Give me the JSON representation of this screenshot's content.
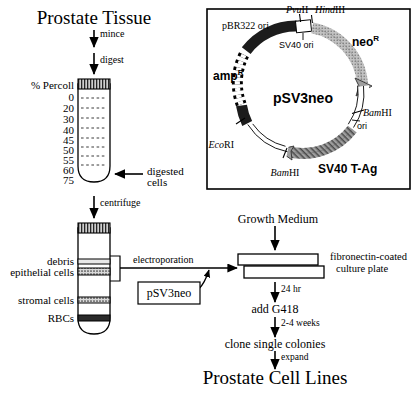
{
  "figure": {
    "title_top": "Prostate Tissue",
    "title_bottom": "Prostate Cell Lines"
  },
  "steps": {
    "mince": "mince",
    "digest": "digest",
    "centrifuge": "centrifuge",
    "electroporation": "electroporation",
    "incubate_24hr": "24 hr",
    "add_g418": "add G418",
    "weeks_2_4": "2-4 weeks",
    "clone_colonies": "clone single colonies",
    "expand": "expand"
  },
  "percoll_tube": {
    "axis_label": "% Percoll",
    "gradient_values": [
      "0",
      "20",
      "30",
      "40",
      "45",
      "50",
      "55",
      "60",
      "75"
    ],
    "callout": [
      "digested",
      "cells"
    ]
  },
  "separation_tube": {
    "layers": [
      {
        "name": "debris",
        "label": "debris"
      },
      {
        "name": "epithelial-cells",
        "label": "epithelial cells"
      },
      {
        "name": "stromal-cells",
        "label": "stromal cells"
      },
      {
        "name": "rbcs",
        "label": "RBCs"
      }
    ]
  },
  "plasmid": {
    "name": "pSV3neo",
    "genes": [
      {
        "id": "pbr322-ori",
        "label": "pBR322 ori"
      },
      {
        "id": "amp-r",
        "label": "amp",
        "superscript": "R"
      },
      {
        "id": "neo-r",
        "label": "neo",
        "superscript": "R"
      },
      {
        "id": "sv40-t-ag",
        "label": "SV40 T-Ag"
      }
    ],
    "features": [
      {
        "id": "sv40-ori",
        "label": "SV40 ori"
      },
      {
        "id": "bamhi-ori",
        "label": "ori"
      }
    ],
    "restriction_sites": [
      {
        "id": "pvuii",
        "italic": "Pvu",
        "roman": "II"
      },
      {
        "id": "hindiii",
        "italic": "Hind",
        "roman": "III"
      },
      {
        "id": "ecori",
        "italic": "Eco",
        "roman": "RI"
      },
      {
        "id": "bamhi-right",
        "italic": "Bam",
        "roman": "HI"
      },
      {
        "id": "bamhi-bottom",
        "italic": "Bam",
        "roman": "HI"
      }
    ]
  },
  "plasmid_box_label": "pSV3neo",
  "culture": {
    "growth_medium": "Growth Medium",
    "plate_label": [
      "fibronectin-coated",
      "culture plate"
    ]
  },
  "colors": {
    "ink": "#000000",
    "background": "#ffffff",
    "dark_segment": "#1c1c1c",
    "mid_segment": "#7d7d7d",
    "light_segment": "#b5b5b5",
    "band_fill": "#9a9a9a"
  }
}
